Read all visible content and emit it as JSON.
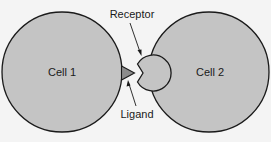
{
  "diagram": {
    "cells": [
      {
        "label": "Cell 1"
      },
      {
        "label": "Cell 2"
      }
    ],
    "annotations": {
      "receptor": "Receptor",
      "ligand": "Ligand"
    },
    "colors": {
      "cell_fill": "#c4c4c4",
      "ligand_fill": "#8c8c8c",
      "outline": "#1a1a1a",
      "background": "#f4f4f4"
    }
  }
}
